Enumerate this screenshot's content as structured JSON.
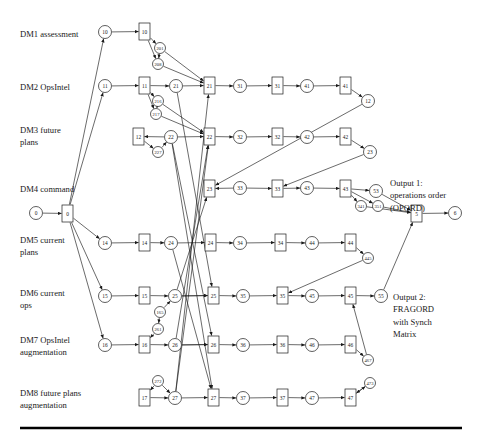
{
  "diagram": {
    "type": "activity-network-graph",
    "title": "",
    "background": "#ffffff",
    "stroke_color": "#1a1a1a",
    "row_labels": [
      {
        "id": "dm1",
        "text": "DM1 assessment",
        "x": 20,
        "y": 37
      },
      {
        "id": "dm2",
        "text": "DM2 OpsIntel",
        "x": 20,
        "y": 90
      },
      {
        "id": "dm3",
        "text": "DM3 future",
        "x": 20,
        "y": 133
      },
      {
        "id": "dm3b",
        "text": "plans",
        "x": 20,
        "y": 145
      },
      {
        "id": "dm4",
        "text": "DM4 command",
        "x": 20,
        "y": 192
      },
      {
        "id": "dm5",
        "text": "DM5 current",
        "x": 20,
        "y": 243
      },
      {
        "id": "dm5b",
        "text": "plans",
        "x": 20,
        "y": 255
      },
      {
        "id": "dm6",
        "text": "DM6 current",
        "x": 20,
        "y": 296
      },
      {
        "id": "dm6b",
        "text": "ops",
        "x": 20,
        "y": 308
      },
      {
        "id": "dm7",
        "text": "DM7 OpsIntel",
        "x": 20,
        "y": 343
      },
      {
        "id": "dm7b",
        "text": "augmentation",
        "x": 20,
        "y": 355
      },
      {
        "id": "dm8",
        "text": "DM8 future plans",
        "x": 20,
        "y": 396
      },
      {
        "id": "dm8b",
        "text": "augmentation",
        "x": 20,
        "y": 408
      }
    ],
    "output_labels": [
      {
        "id": "out1",
        "lines": [
          "Output 1:",
          "operations order",
          "(OPORD)"
        ],
        "x": 390,
        "y": 186
      },
      {
        "id": "out2",
        "lines": [
          "Output 2:",
          "FRAGORD",
          "with Synch",
          "Matrix"
        ],
        "x": 393,
        "y": 300
      }
    ],
    "circle_nodes": [
      {
        "id": "c0",
        "label": "0",
        "cx": 36,
        "cy": 213,
        "r": 6.5
      },
      {
        "id": "c10",
        "label": "10",
        "cx": 105,
        "cy": 32,
        "r": 6.5
      },
      {
        "id": "c201",
        "label": "201",
        "cx": 160,
        "cy": 48,
        "r": 5.5
      },
      {
        "id": "c208",
        "label": "208",
        "cx": 158,
        "cy": 64,
        "r": 5.5
      },
      {
        "id": "c11",
        "label": "11",
        "cx": 105,
        "cy": 86,
        "r": 6.5
      },
      {
        "id": "c21",
        "label": "21",
        "cx": 176,
        "cy": 86,
        "r": 6.5
      },
      {
        "id": "c31",
        "label": "31",
        "cx": 240,
        "cy": 86,
        "r": 6.5
      },
      {
        "id": "c41",
        "label": "41",
        "cx": 307,
        "cy": 86,
        "r": 6.5
      },
      {
        "id": "c12",
        "label": "12",
        "cx": 368,
        "cy": 101,
        "r": 6.5
      },
      {
        "id": "c216",
        "label": "216",
        "cx": 158,
        "cy": 101,
        "r": 5.5
      },
      {
        "id": "c217",
        "label": "217",
        "cx": 156,
        "cy": 114,
        "r": 5.5
      },
      {
        "id": "c22",
        "label": "22",
        "cx": 171,
        "cy": 137,
        "r": 6.5
      },
      {
        "id": "c227",
        "label": "227",
        "cx": 158,
        "cy": 152,
        "r": 5.5
      },
      {
        "id": "c32",
        "label": "32",
        "cx": 240,
        "cy": 137,
        "r": 6.5
      },
      {
        "id": "c42",
        "label": "42",
        "cx": 307,
        "cy": 137,
        "r": 6.5
      },
      {
        "id": "c23",
        "label": "23",
        "cx": 370,
        "cy": 152,
        "r": 6.5
      },
      {
        "id": "c33",
        "label": "33",
        "cx": 240,
        "cy": 188,
        "r": 6.5
      },
      {
        "id": "c43",
        "label": "43",
        "cx": 307,
        "cy": 188,
        "r": 6.5
      },
      {
        "id": "c53",
        "label": "53",
        "cx": 376,
        "cy": 191,
        "r": 6.5
      },
      {
        "id": "c341",
        "label": "341",
        "cx": 361,
        "cy": 206,
        "r": 5.5
      },
      {
        "id": "c351",
        "label": "351",
        "cx": 378,
        "cy": 206,
        "r": 5.5
      },
      {
        "id": "c6",
        "label": "6",
        "cx": 455,
        "cy": 213,
        "r": 6.5
      },
      {
        "id": "c14",
        "label": "14",
        "cx": 105,
        "cy": 243,
        "r": 6.5
      },
      {
        "id": "c24",
        "label": "24",
        "cx": 171,
        "cy": 243,
        "r": 6.5
      },
      {
        "id": "c34",
        "label": "34",
        "cx": 240,
        "cy": 243,
        "r": 6.5
      },
      {
        "id": "c44",
        "label": "44",
        "cx": 312,
        "cy": 243,
        "r": 6.5
      },
      {
        "id": "c45b",
        "label": "445",
        "cx": 368,
        "cy": 258,
        "r": 5.5
      },
      {
        "id": "c15",
        "label": "15",
        "cx": 105,
        "cy": 296,
        "r": 6.5
      },
      {
        "id": "c25",
        "label": "25",
        "cx": 175,
        "cy": 296,
        "r": 6.5
      },
      {
        "id": "c165",
        "label": "165",
        "cx": 160,
        "cy": 312,
        "r": 5.5
      },
      {
        "id": "c35",
        "label": "35",
        "cx": 243,
        "cy": 296,
        "r": 6.5
      },
      {
        "id": "c45",
        "label": "45",
        "cx": 312,
        "cy": 296,
        "r": 6.5
      },
      {
        "id": "c55",
        "label": "55",
        "cx": 381,
        "cy": 296,
        "r": 6.5
      },
      {
        "id": "c261",
        "label": "261",
        "cx": 158,
        "cy": 329,
        "r": 5.5
      },
      {
        "id": "c16",
        "label": "16",
        "cx": 105,
        "cy": 345,
        "r": 6.5
      },
      {
        "id": "c26",
        "label": "26",
        "cx": 175,
        "cy": 345,
        "r": 6.5
      },
      {
        "id": "c36",
        "label": "36",
        "cx": 243,
        "cy": 345,
        "r": 6.5
      },
      {
        "id": "c46",
        "label": "46",
        "cx": 312,
        "cy": 345,
        "r": 6.5
      },
      {
        "id": "c467",
        "label": "467",
        "cx": 368,
        "cy": 360,
        "r": 5.5
      },
      {
        "id": "c272",
        "label": "272",
        "cx": 158,
        "cy": 381,
        "r": 5.5
      },
      {
        "id": "c27",
        "label": "27",
        "cx": 175,
        "cy": 398,
        "r": 6.5
      },
      {
        "id": "c37",
        "label": "37",
        "cx": 243,
        "cy": 398,
        "r": 6.5
      },
      {
        "id": "c47",
        "label": "47",
        "cx": 312,
        "cy": 398,
        "r": 6.5
      },
      {
        "id": "c473",
        "label": "473",
        "cx": 370,
        "cy": 383,
        "r": 5.5
      }
    ],
    "rect_nodes": [
      {
        "id": "r0",
        "label": "0",
        "x": 62,
        "y": 205,
        "w": 11,
        "h": 17
      },
      {
        "id": "r10",
        "label": "10",
        "x": 139,
        "y": 23,
        "w": 11,
        "h": 17
      },
      {
        "id": "r11",
        "label": "11",
        "x": 139,
        "y": 77,
        "w": 11,
        "h": 17
      },
      {
        "id": "r21",
        "label": "21",
        "x": 204,
        "y": 77,
        "w": 11,
        "h": 17
      },
      {
        "id": "r31",
        "label": "31",
        "x": 272,
        "y": 77,
        "w": 11,
        "h": 17
      },
      {
        "id": "r41",
        "label": "41",
        "x": 340,
        "y": 77,
        "w": 11,
        "h": 17
      },
      {
        "id": "r12",
        "label": "12",
        "x": 133,
        "y": 128,
        "w": 11,
        "h": 17
      },
      {
        "id": "r22",
        "label": "22",
        "x": 204,
        "y": 128,
        "w": 11,
        "h": 17
      },
      {
        "id": "r32",
        "label": "32",
        "x": 272,
        "y": 128,
        "w": 11,
        "h": 17
      },
      {
        "id": "r42",
        "label": "42",
        "x": 340,
        "y": 128,
        "w": 11,
        "h": 17
      },
      {
        "id": "r23",
        "label": "23",
        "x": 204,
        "y": 180,
        "w": 11,
        "h": 17
      },
      {
        "id": "r33",
        "label": "33",
        "x": 272,
        "y": 180,
        "w": 11,
        "h": 17
      },
      {
        "id": "r43",
        "label": "43",
        "x": 340,
        "y": 180,
        "w": 11,
        "h": 17
      },
      {
        "id": "r5",
        "label": "5",
        "x": 411,
        "y": 205,
        "w": 11,
        "h": 17
      },
      {
        "id": "r14",
        "label": "14",
        "x": 139,
        "y": 234,
        "w": 11,
        "h": 17
      },
      {
        "id": "r24",
        "label": "24",
        "x": 205,
        "y": 234,
        "w": 11,
        "h": 17
      },
      {
        "id": "r34",
        "label": "34",
        "x": 275,
        "y": 234,
        "w": 11,
        "h": 17
      },
      {
        "id": "r44",
        "label": "44",
        "x": 345,
        "y": 234,
        "w": 11,
        "h": 17
      },
      {
        "id": "r15",
        "label": "15",
        "x": 139,
        "y": 287,
        "w": 11,
        "h": 17
      },
      {
        "id": "r25",
        "label": "25",
        "x": 208,
        "y": 287,
        "w": 11,
        "h": 17
      },
      {
        "id": "r35",
        "label": "35",
        "x": 277,
        "y": 287,
        "w": 11,
        "h": 17
      },
      {
        "id": "r45",
        "label": "45",
        "x": 345,
        "y": 287,
        "w": 11,
        "h": 17
      },
      {
        "id": "r16",
        "label": "16",
        "x": 139,
        "y": 336,
        "w": 11,
        "h": 17
      },
      {
        "id": "r26",
        "label": "26",
        "x": 208,
        "y": 336,
        "w": 11,
        "h": 17
      },
      {
        "id": "r36",
        "label": "36",
        "x": 277,
        "y": 336,
        "w": 11,
        "h": 17
      },
      {
        "id": "r46",
        "label": "46",
        "x": 345,
        "y": 336,
        "w": 11,
        "h": 17
      },
      {
        "id": "r17",
        "label": "17",
        "x": 139,
        "y": 389,
        "w": 11,
        "h": 17
      },
      {
        "id": "r27",
        "label": "27",
        "x": 208,
        "y": 389,
        "w": 11,
        "h": 17
      },
      {
        "id": "r37",
        "label": "37",
        "x": 277,
        "y": 389,
        "w": 11,
        "h": 17
      },
      {
        "id": "r47",
        "label": "47",
        "x": 345,
        "y": 389,
        "w": 11,
        "h": 17
      }
    ],
    "rule": {
      "x1": 20,
      "y1": 428,
      "x2": 462,
      "y2": 428,
      "thickness": 2.6
    }
  }
}
